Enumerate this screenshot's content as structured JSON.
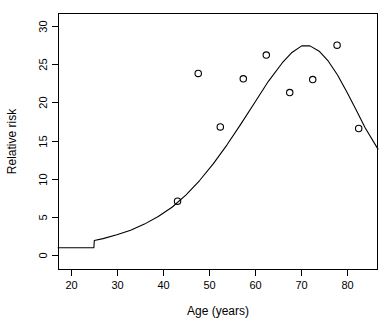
{
  "chart_data": {
    "type": "scatter",
    "title": "",
    "xlabel": "Age (years)",
    "ylabel": "Relative risk",
    "xlim": [
      17.2,
      86.8
    ],
    "ylim": [
      -1.9,
      31.7
    ],
    "xticks": [
      20,
      30,
      40,
      50,
      60,
      70,
      80
    ],
    "xtick_labels": [
      "20",
      "30",
      "40",
      "50",
      "60",
      "70",
      "80"
    ],
    "yticks": [
      0,
      5,
      10,
      15,
      20,
      25,
      30
    ],
    "ytick_labels": [
      "0",
      "5",
      "10",
      "15",
      "20",
      "25",
      "30"
    ],
    "grid": false,
    "legend": null,
    "series": [
      {
        "name": "Observed relative risk",
        "type": "scatter",
        "marker": "open-circle",
        "color": "#000000",
        "points": [
          {
            "x": 43.2,
            "y": 7.1
          },
          {
            "x": 47.7,
            "y": 23.8
          },
          {
            "x": 52.5,
            "y": 16.8
          },
          {
            "x": 57.5,
            "y": 23.1
          },
          {
            "x": 62.5,
            "y": 26.2
          },
          {
            "x": 67.6,
            "y": 21.3
          },
          {
            "x": 72.6,
            "y": 23.0
          },
          {
            "x": 77.9,
            "y": 27.5
          },
          {
            "x": 82.6,
            "y": 16.6
          }
        ]
      },
      {
        "name": "Fitted model",
        "type": "line",
        "color": "#000000",
        "points": [
          {
            "x": 17.2,
            "y": 1.0
          },
          {
            "x": 25.0,
            "y": 1.0
          },
          {
            "x": 25.1,
            "y": 1.95
          },
          {
            "x": 27.0,
            "y": 2.2
          },
          {
            "x": 30.0,
            "y": 2.7
          },
          {
            "x": 33.0,
            "y": 3.3
          },
          {
            "x": 36.0,
            "y": 4.1
          },
          {
            "x": 39.0,
            "y": 5.1
          },
          {
            "x": 42.0,
            "y": 6.3
          },
          {
            "x": 45.0,
            "y": 7.9
          },
          {
            "x": 48.0,
            "y": 9.8
          },
          {
            "x": 51.0,
            "y": 12.0
          },
          {
            "x": 54.0,
            "y": 14.5
          },
          {
            "x": 57.0,
            "y": 17.2
          },
          {
            "x": 60.0,
            "y": 20.0
          },
          {
            "x": 63.0,
            "y": 22.8
          },
          {
            "x": 66.0,
            "y": 25.2
          },
          {
            "x": 68.0,
            "y": 26.5
          },
          {
            "x": 70.2,
            "y": 27.4
          },
          {
            "x": 72.0,
            "y": 27.4
          },
          {
            "x": 74.0,
            "y": 26.7
          },
          {
            "x": 76.0,
            "y": 25.4
          },
          {
            "x": 78.0,
            "y": 23.6
          },
          {
            "x": 80.0,
            "y": 21.4
          },
          {
            "x": 82.0,
            "y": 19.1
          },
          {
            "x": 84.0,
            "y": 16.7
          },
          {
            "x": 86.8,
            "y": 13.9
          }
        ]
      }
    ]
  }
}
